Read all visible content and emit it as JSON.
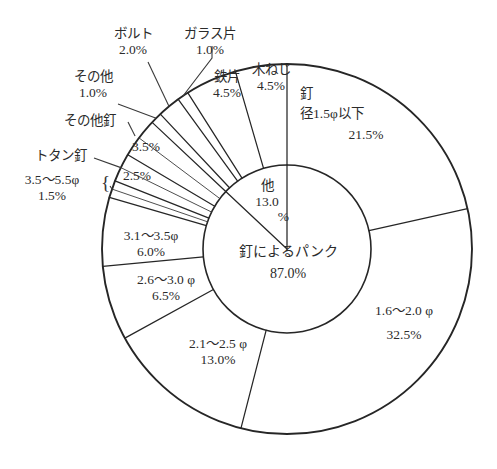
{
  "title": "　　　　　　　",
  "geometry": {
    "cx": 287,
    "cy": 249,
    "outer_r": 185,
    "inner_r": 84
  },
  "colors": {
    "stroke": "#262626",
    "text": "#2b2b2b",
    "bg": "#ffffff"
  },
  "chart_data": {
    "type": "pie",
    "title": "",
    "variant": "nested-donut",
    "inner_ring": {
      "name": "原因区分",
      "slices": [
        {
          "label": "釘によるパンク",
          "value": 87.0,
          "value_text": "87.0%"
        },
        {
          "label": "他",
          "value": 13.0,
          "value_text": "13.0\n%"
        }
      ]
    },
    "outer_ring": {
      "name": "内訳",
      "slices": [
        {
          "label": "釘\n径1.5φ以下",
          "label_line1": "釘",
          "label_line2": "径1.5φ以下",
          "value": 21.5,
          "value_text": "21.5%",
          "placement": "inside"
        },
        {
          "label": "1.6〜2.0φ",
          "value": 32.5,
          "value_text": "32.5%",
          "placement": "inside"
        },
        {
          "label": "2.1〜2.5φ",
          "value": 13.0,
          "value_text": "13.0%",
          "placement": "inside"
        },
        {
          "label": "2.6〜3.0φ",
          "value": 6.5,
          "value_text": "6.5%",
          "placement": "inside"
        },
        {
          "label": "3.1〜3.5φ",
          "value": 6.0,
          "value_text": "6.0%",
          "placement": "inside"
        },
        {
          "label": "3.5〜5.5φ",
          "value": 1.5,
          "value_text": "1.5%",
          "placement": "outside-left"
        },
        {
          "label": "トタン釘",
          "value": 2.5,
          "value_text": "2.5%",
          "placement": "callout-left"
        },
        {
          "label": "その他釘",
          "value": 3.5,
          "value_text": "3.5%",
          "placement": "callout-left"
        },
        {
          "label": "その他",
          "value": 1.0,
          "value_text": "1.0%",
          "placement": "callout-upper-left"
        },
        {
          "label": "ボルト",
          "value": 2.0,
          "value_text": "2.0%",
          "placement": "callout-top"
        },
        {
          "label": "ガラス片",
          "value": 1.0,
          "value_text": "1.0%",
          "placement": "callout-top"
        },
        {
          "label": "鉄片",
          "value": 4.5,
          "value_text": "4.5%",
          "placement": "inside"
        },
        {
          "label": "木ねじ",
          "value": 4.5,
          "value_text": "4.5%",
          "placement": "inside"
        }
      ]
    },
    "units": "%",
    "legend": "none",
    "grid": false
  },
  "labels": {
    "bolt_name": "ボルト",
    "bolt_pct": "2.0%",
    "glass_name": "ガラス片",
    "glass_pct": "1.0%",
    "other_name": "その他",
    "other_pct": "1.0%",
    "othernail_name": "その他釘",
    "othernail_pct": "3.5%",
    "totan_name": "トタン釘",
    "totan_range": "3.5〜5.5φ",
    "totan_pct": "1.5%",
    "totan_inner_pct": "2.5%",
    "tetsu_name": "鉄片",
    "tetsu_pct": "4.5%",
    "kineji_name": "木ねじ",
    "kineji_pct": "4.5%",
    "kugi_name": "釘",
    "kugi_range": "径1.5φ以下",
    "kugi_pct": "21.5%",
    "r16_range": "1.6〜2.0 φ",
    "r16_pct": "32.5%",
    "r21_range": "2.1〜2.5 φ",
    "r21_pct": "13.0%",
    "r26_range": "2.6〜3.0 φ",
    "r26_pct": "6.5%",
    "r31_range": "3.1〜3.5φ",
    "r31_pct": "6.0%",
    "center_name": "釘によるパンク",
    "center_pct": "87.0%",
    "hoka_name": "他",
    "hoka_pct_a": "13.0",
    "hoka_pct_b": "%",
    "brace_glyph": "{"
  }
}
